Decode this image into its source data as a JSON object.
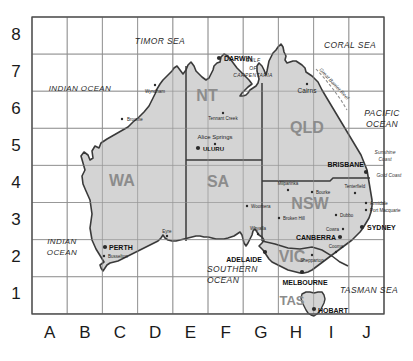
{
  "map": {
    "title": "Australia grid reference map",
    "colors": {
      "land_fill": "#d4d4d4",
      "land_stroke": "#3a3a3a",
      "grid_line": "#9a9a9a",
      "frame": "#4a4a4a",
      "state_label": "#8c8c8c",
      "text": "#1a1a1a",
      "water": "#ffffff",
      "reef": "#b0b0b0"
    },
    "grid": {
      "columns": [
        "A",
        "B",
        "C",
        "D",
        "E",
        "F",
        "G",
        "H",
        "I",
        "J"
      ],
      "rows": [
        "8",
        "7",
        "6",
        "5",
        "4",
        "3",
        "2",
        "1"
      ],
      "left": 32,
      "top": 17,
      "cell_w": 35.2,
      "cell_h": 37.1
    },
    "states": [
      {
        "name": "WA",
        "x": 122,
        "y": 186
      },
      {
        "name": "NT",
        "x": 207,
        "y": 101
      },
      {
        "name": "SA",
        "x": 218,
        "y": 187
      },
      {
        "name": "QLD",
        "x": 307,
        "y": 133
      },
      {
        "name": "NSW",
        "x": 310,
        "y": 209
      },
      {
        "name": "VIC",
        "x": 292,
        "y": 262
      },
      {
        "name": "TAS",
        "x": 292,
        "y": 305
      }
    ],
    "oceans": [
      {
        "name": "INDIAN OCEAN",
        "lines": [
          "INDIAN OCEAN"
        ],
        "x": 80,
        "y": 91,
        "size": 8,
        "align": "center"
      },
      {
        "name": "INDIAN OCEAN (SW)",
        "lines": [
          "INDIAN",
          "OCEAN"
        ],
        "x": 62,
        "y": 244,
        "size": 8,
        "align": "center"
      },
      {
        "name": "TIMOR SEA",
        "lines": [
          "TIMOR SEA"
        ],
        "x": 160,
        "y": 44,
        "size": 8.5,
        "align": "center"
      },
      {
        "name": "CORAL SEA",
        "lines": [
          "CORAL SEA"
        ],
        "x": 350,
        "y": 48,
        "size": 8.5,
        "align": "center"
      },
      {
        "name": "PACIFIC OCEAN",
        "lines": [
          "PACIFIC",
          "OCEAN"
        ],
        "x": 382,
        "y": 116,
        "size": 8.5,
        "align": "center"
      },
      {
        "name": "SOUTHERN OCEAN",
        "lines": [
          "SOUTHERN",
          "OCEAN"
        ],
        "x": 207,
        "y": 272,
        "size": 8.5,
        "align": "start"
      },
      {
        "name": "TASMAN SEA",
        "lines": [
          "TASMAN SEA"
        ],
        "x": 369,
        "y": 293,
        "size": 8.5,
        "align": "center"
      },
      {
        "name": "GULF OF CARPENTARIA",
        "lines": [
          "GULF",
          "OF",
          "CARPENTARIA"
        ],
        "x": 253,
        "y": 62,
        "size": 5,
        "align": "center"
      }
    ],
    "features": [
      {
        "name": "Great Barrier Reef",
        "label": "Great Barrier Reef",
        "x": 333,
        "y": 85,
        "rotate": 47,
        "size": 5
      },
      {
        "name": "Sunshine Coast",
        "label": "Sunshine Coast",
        "lines": [
          "Sunshine",
          "Coast"
        ],
        "x": 385,
        "y": 154,
        "size": 5
      },
      {
        "name": "Gold Coast",
        "label": "Gold Coast",
        "x": 389,
        "y": 177,
        "size": 5
      }
    ],
    "capitals": [
      {
        "name": "DARWIN",
        "label": "DARWIN",
        "dot_x": 219,
        "dot_y": 58,
        "tx": 224,
        "ty": 61,
        "anchor": "start",
        "size": 7
      },
      {
        "name": "BRISBANE",
        "label": "BRISBANE",
        "dot_x": 366,
        "dot_y": 172,
        "tx": 364,
        "ty": 167,
        "anchor": "end",
        "size": 7
      },
      {
        "name": "SYDNEY",
        "label": "SYDNEY",
        "dot_x": 362,
        "dot_y": 227,
        "tx": 367,
        "ty": 230,
        "anchor": "start",
        "size": 7
      },
      {
        "name": "CANBERRA",
        "label": "CANBERRA",
        "dot_x": 340,
        "dot_y": 237,
        "tx": 336,
        "ty": 240,
        "anchor": "end",
        "size": 7
      },
      {
        "name": "MELBOURNE",
        "label": "MELBOURNE",
        "dot_x": 302,
        "dot_y": 272,
        "tx": 305,
        "ty": 285,
        "anchor": "middle",
        "size": 7
      },
      {
        "name": "ADELAIDE",
        "label": "ADELAIDE",
        "dot_x": 265,
        "dot_y": 252,
        "tx": 262,
        "ty": 262,
        "anchor": "end",
        "size": 7
      },
      {
        "name": "PERTH",
        "label": "PERTH",
        "dot_x": 105,
        "dot_y": 247,
        "tx": 109,
        "ty": 250,
        "anchor": "start",
        "size": 7
      },
      {
        "name": "HOBART",
        "label": "HOBART",
        "dot_x": 314,
        "dot_y": 309,
        "tx": 318,
        "ty": 313,
        "anchor": "start",
        "size": 7
      },
      {
        "name": "ULURU",
        "label": "ULURU",
        "dot_x": 198,
        "dot_y": 148,
        "tx": 203,
        "ty": 151,
        "anchor": "start",
        "size": 6
      }
    ],
    "towns": [
      {
        "name": "Wyndham",
        "label": "Wyndham",
        "dot_x": 155,
        "dot_y": 85,
        "tx": 155,
        "ty": 93,
        "anchor": "middle",
        "size": 4.5
      },
      {
        "name": "Broome",
        "label": "Broome",
        "dot_x": 122,
        "dot_y": 119,
        "tx": 127,
        "ty": 121,
        "anchor": "start",
        "size": 4.5
      },
      {
        "name": "Tennant Creek",
        "label": "Tennant Creek",
        "dot_x": 223,
        "dot_y": 113,
        "tx": 223,
        "ty": 120,
        "anchor": "middle",
        "size": 4.5
      },
      {
        "name": "Alice Springs",
        "label": "Alice Springs",
        "dot_x": 215,
        "dot_y": 144,
        "tx": 215,
        "ty": 139,
        "anchor": "middle",
        "size": 6
      },
      {
        "name": "Cairns",
        "label": "Cairns",
        "dot_x": 307,
        "dot_y": 84,
        "tx": 307,
        "ty": 93,
        "anchor": "middle",
        "size": 6.5
      },
      {
        "name": "Woomera",
        "label": "Woomera",
        "dot_x": 247,
        "dot_y": 206,
        "tx": 251,
        "ty": 208,
        "anchor": "start",
        "size": 4.5
      },
      {
        "name": "Milparinka",
        "label": "Milparinka",
        "dot_x": 288,
        "dot_y": 190,
        "tx": 288,
        "ty": 185,
        "anchor": "middle",
        "size": 4.5
      },
      {
        "name": "Bourke",
        "label": "Bourke",
        "dot_x": 312,
        "dot_y": 192,
        "tx": 316,
        "ty": 194,
        "anchor": "start",
        "size": 4.5
      },
      {
        "name": "Broken Hill",
        "label": "Broken Hill",
        "dot_x": 279,
        "dot_y": 218,
        "tx": 283,
        "ty": 220,
        "anchor": "start",
        "size": 4.5
      },
      {
        "name": "Dubbo",
        "label": "Dubbo",
        "dot_x": 336,
        "dot_y": 215,
        "tx": 340,
        "ty": 217,
        "anchor": "start",
        "size": 4.5
      },
      {
        "name": "Cowra",
        "label": "Cowra",
        "dot_x": 343,
        "dot_y": 229,
        "tx": 339,
        "ty": 231,
        "anchor": "end",
        "size": 4.5
      },
      {
        "name": "Tenterfield",
        "label": "Tenterfield",
        "dot_x": 355,
        "dot_y": 193,
        "tx": 355,
        "ty": 188,
        "anchor": "middle",
        "size": 4.5
      },
      {
        "name": "Armidale",
        "label": "Armidale",
        "dot_x": 366,
        "dot_y": 203,
        "tx": 370,
        "ty": 205,
        "anchor": "start",
        "size": 4.5
      },
      {
        "name": "Port Macquarie",
        "label": "Port Macquarie",
        "dot_x": 366,
        "dot_y": 210,
        "tx": 370,
        "ty": 212,
        "anchor": "start",
        "size": 4.5
      },
      {
        "name": "Whyalla",
        "label": "Whyalla",
        "dot_x": 258,
        "dot_y": 234,
        "tx": 258,
        "ty": 230,
        "anchor": "middle",
        "size": 4.5
      },
      {
        "name": "Shepparton",
        "label": "Shepparton",
        "dot_x": 312,
        "dot_y": 255,
        "tx": 312,
        "ty": 262,
        "anchor": "middle",
        "size": 4.5
      },
      {
        "name": "Cooma",
        "label": "Cooma",
        "dot_x": 336,
        "dot_y": 252,
        "tx": 336,
        "ty": 248,
        "anchor": "middle",
        "size": 4.5
      },
      {
        "name": "Eyre",
        "label": "Eyre",
        "dot_x": 167,
        "dot_y": 236,
        "tx": 167,
        "ty": 233,
        "anchor": "middle",
        "size": 4.5
      },
      {
        "name": "Busselton",
        "label": "Busselton",
        "dot_x": 104,
        "dot_y": 256,
        "tx": 108,
        "ty": 258,
        "anchor": "start",
        "size": 4.5
      }
    ]
  }
}
